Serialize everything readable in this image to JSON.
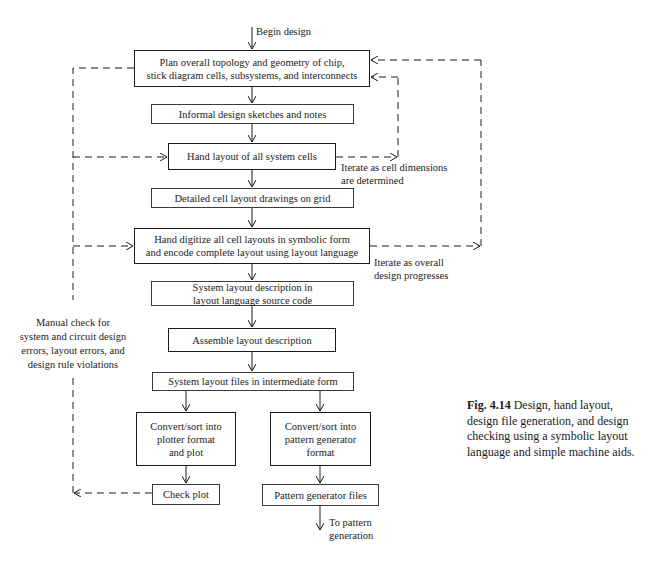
{
  "figure": {
    "number": "Fig. 4.14",
    "caption": "Design, hand layout, design file generation, and design checking using a symbolic layout language and simple machine aids."
  },
  "start": {
    "label": "Begin design"
  },
  "nodes": [
    {
      "id": "plan",
      "text": "Plan overall topology and geometry of chip,\nstick diagram cells, subsystems, and interconnects",
      "border": "thick"
    },
    {
      "id": "sketches",
      "text": "Informal design sketches and notes",
      "border": "thin"
    },
    {
      "id": "hand-layout",
      "text": "Hand layout of all system cells",
      "border": "thick"
    },
    {
      "id": "detailed",
      "text": "Detailed cell layout drawings on grid",
      "border": "thin"
    },
    {
      "id": "digitize",
      "text": "Hand digitize all cell layouts in symbolic form\nand encode complete layout using layout language",
      "border": "thick"
    },
    {
      "id": "source",
      "text": "System layout description in\nlayout language source code",
      "border": "thin"
    },
    {
      "id": "assemble",
      "text": "Assemble layout description",
      "border": "thick"
    },
    {
      "id": "intermediate",
      "text": "System layout files in intermediate form",
      "border": "thin"
    },
    {
      "id": "plotter",
      "text": "Convert/sort into\nplotter format\nand plot",
      "border": "thick"
    },
    {
      "id": "pg-format",
      "text": "Convert/sort into\npattern generator\nformat",
      "border": "thick"
    },
    {
      "id": "check-plot",
      "text": "Check plot",
      "border": "thin"
    },
    {
      "id": "pg-files",
      "text": "Pattern generator files",
      "border": "thin"
    }
  ],
  "annotations": {
    "iterate_cells": "Iterate as cell dimensions\nare determined",
    "iterate_overall": "Iterate as overall\ndesign progresses",
    "manual_check": "Manual check for\nsystem and circuit design\nerrors, layout errors, and\ndesign rule violations",
    "end": "To pattern\ngeneration"
  },
  "colors": {
    "ink": "#1a1a1a",
    "background": "#ffffff"
  }
}
